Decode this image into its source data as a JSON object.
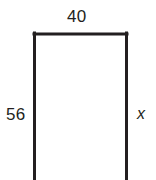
{
  "figure": {
    "kind": "rectangle-dimension-diagram",
    "background_color": "#ffffff",
    "stroke_color": "#231f20",
    "stroke_width": 3,
    "text_color": "#231f20",
    "note": "Rectangle outline with bottom edge cropped by the image boundary"
  },
  "shape": {
    "name": "rectangle",
    "left_x": 34,
    "right_x": 127,
    "top_y": 34,
    "bottom_y": 180
  },
  "labels": {
    "top": {
      "text": "40",
      "meaning": "top-side-length",
      "position": "above-top-edge"
    },
    "left": {
      "text": "56",
      "meaning": "left-side-length",
      "position": "left-of-left-edge"
    },
    "right": {
      "text": "x",
      "meaning": "unknown-right-side-length",
      "position": "right-of-right-edge",
      "style": "italic"
    }
  }
}
